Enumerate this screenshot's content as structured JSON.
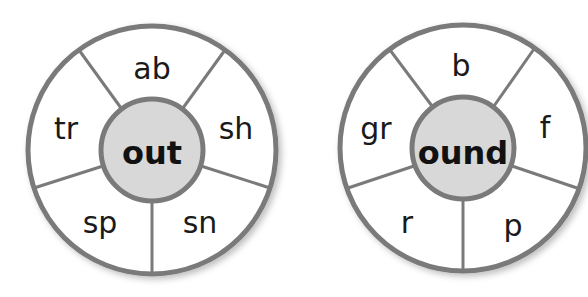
{
  "wheels": [
    {
      "hub": "out",
      "segments": [
        "ab",
        "sh",
        "sn",
        "sp",
        "tr"
      ]
    },
    {
      "hub": "ound",
      "segments": [
        "b",
        "f",
        "p",
        "r",
        "gr"
      ]
    }
  ],
  "colors": {
    "ring": "#7a7a7a",
    "hub_fill": "#d8d8d8",
    "segment_fill": "#ffffff",
    "text": "#1a1a1a"
  }
}
